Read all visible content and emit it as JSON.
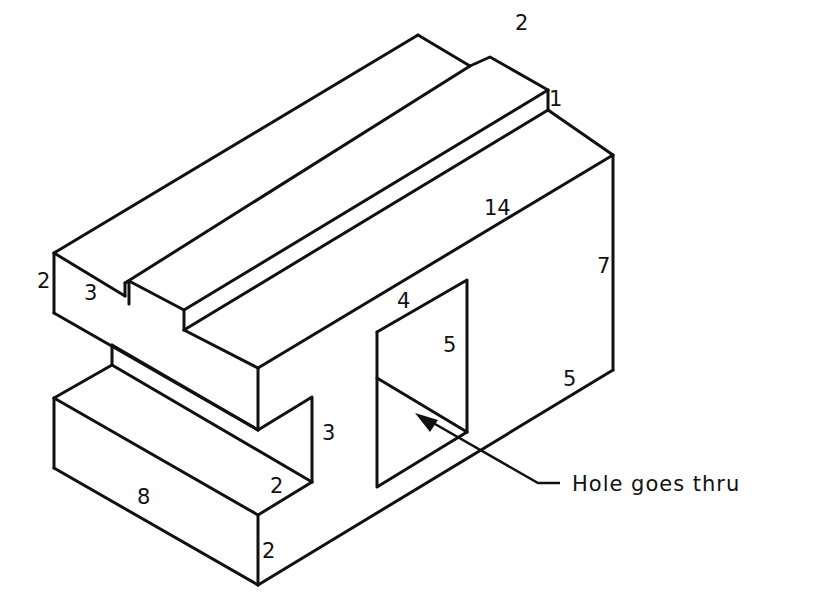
{
  "figure": {
    "type": "isometric-drawing",
    "line_color": "#111111",
    "background": "#ffffff"
  },
  "dimensions": {
    "top_rail_width": "2",
    "top_step_height": "1",
    "overall_length": "14",
    "right_height": "7",
    "left_top_height": "2",
    "left_notch_width": "3",
    "hole_width": "4",
    "hole_height": "5",
    "right_depth": "5",
    "slot_height": "3",
    "slot_depth": "2",
    "base_length": "8",
    "base_height": "2"
  },
  "annotation": {
    "hole_note": "Hole goes thru"
  }
}
